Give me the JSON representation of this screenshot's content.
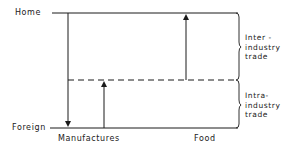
{
  "diagram": {
    "axis_labels": {
      "top": "Home",
      "bottom": "Foreign",
      "bottom_left": "Manufactures",
      "bottom_right": "Food"
    },
    "brackets": [
      {
        "lines": [
          "Inter -",
          "industry",
          "trade"
        ]
      },
      {
        "lines": [
          "Intra-",
          "industry",
          "trade"
        ]
      }
    ],
    "colors": {
      "ink": "#1a1a1a",
      "background": "#ffffff"
    }
  }
}
